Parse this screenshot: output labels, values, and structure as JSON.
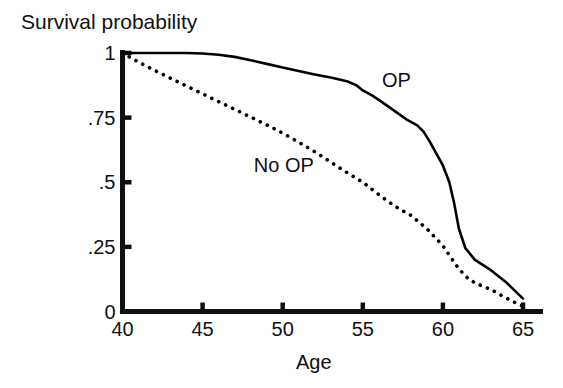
{
  "chart_data": {
    "type": "line",
    "title": "",
    "xlabel": "Age",
    "ylabel": "Survival probability",
    "xlim": [
      40,
      65
    ],
    "ylim": [
      0,
      1
    ],
    "grid": false,
    "legend_position": "inline-annotation",
    "xticks": [
      40,
      45,
      50,
      55,
      60,
      65
    ],
    "xtick_labels": [
      "40",
      "45",
      "50",
      "55",
      "60",
      "65"
    ],
    "yticks": [
      0,
      0.25,
      0.5,
      0.75,
      1
    ],
    "ytick_labels": [
      "0",
      ".25",
      ".5",
      ".75",
      "1"
    ],
    "series": [
      {
        "name": "OP",
        "style": "solid",
        "color": "#000000",
        "label_x": 56.2,
        "label_y": 0.895,
        "x": [
          40.0,
          41.0,
          42.0,
          43.0,
          44.0,
          45.0,
          46.0,
          47.0,
          48.0,
          49.0,
          50.0,
          51.0,
          52.0,
          53.0,
          54.0,
          54.6,
          55.0,
          55.6,
          56.2,
          57.0,
          57.8,
          58.4,
          58.8,
          59.2,
          59.6,
          60.0,
          60.4,
          60.7,
          61.0,
          61.4,
          62.0,
          63.0,
          64.0,
          65.0
        ],
        "y": [
          1.0,
          1.0,
          1.0,
          1.0,
          1.0,
          0.998,
          0.993,
          0.985,
          0.972,
          0.958,
          0.944,
          0.93,
          0.917,
          0.905,
          0.891,
          0.875,
          0.855,
          0.835,
          0.81,
          0.775,
          0.74,
          0.72,
          0.695,
          0.655,
          0.61,
          0.565,
          0.5,
          0.42,
          0.32,
          0.245,
          0.2,
          0.16,
          0.11,
          0.05
        ]
      },
      {
        "name": "No OP",
        "style": "dotted",
        "color": "#000000",
        "label_x": 48.2,
        "label_y": 0.565,
        "x": [
          40.0,
          41.0,
          42.0,
          43.0,
          44.0,
          45.0,
          46.0,
          47.0,
          48.0,
          49.0,
          50.0,
          51.0,
          52.0,
          53.0,
          54.0,
          55.0,
          56.0,
          56.6,
          57.2,
          58.0,
          59.0,
          60.0,
          60.6,
          61.0,
          61.6,
          62.2,
          63.0,
          64.0,
          65.0
        ],
        "y": [
          1.0,
          0.965,
          0.933,
          0.902,
          0.872,
          0.842,
          0.812,
          0.782,
          0.752,
          0.722,
          0.69,
          0.655,
          0.618,
          0.578,
          0.538,
          0.5,
          0.452,
          0.425,
          0.4,
          0.372,
          0.32,
          0.255,
          0.2,
          0.165,
          0.125,
          0.105,
          0.085,
          0.05,
          0.02
        ]
      }
    ]
  },
  "axes": {
    "y_title": "Survival probability",
    "x_title": "Age"
  },
  "colors": {
    "ink": "#101010",
    "background": "#ffffff"
  }
}
